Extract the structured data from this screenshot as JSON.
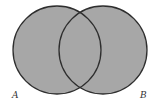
{
  "diagram": {
    "type": "venn",
    "shaded_region": "A ∪ B",
    "sets": [
      {
        "label": "A",
        "cx": 57,
        "cy": 50,
        "r": 44
      },
      {
        "label": "B",
        "cx": 103,
        "cy": 50,
        "r": 44
      }
    ],
    "colors": {
      "fill": "#a7a7a7",
      "stroke": "#2e2e2e",
      "background": "#ffffff"
    }
  }
}
